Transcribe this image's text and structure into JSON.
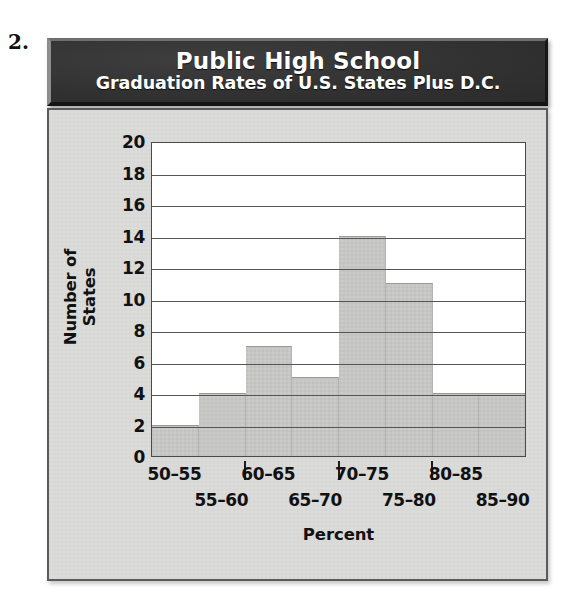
{
  "problem_number": "2.",
  "title": {
    "line1": "Public High School",
    "line2": "Graduation Rates of U.S. States Plus D.C."
  },
  "colors": {
    "banner_background": "#313131",
    "banner_text": "#ffffff",
    "panel_background": "#dcdcda",
    "plot_background": "#ffffff",
    "bar_fill": "#c9c9c7",
    "axis_line": "#4a4a4a",
    "gridline": "#555555",
    "text": "#111111"
  },
  "chart_data": {
    "type": "bar",
    "title": "Public High School Graduation Rates of U.S. States Plus D.C.",
    "xlabel": "Percent",
    "ylabel": "Number of States",
    "categories": [
      "50–55",
      "55–60",
      "60–65",
      "65–70",
      "70–75",
      "75–80",
      "80–85",
      "85–90"
    ],
    "values": [
      2,
      4,
      7,
      5,
      14,
      11,
      4,
      4
    ],
    "ylim": [
      0,
      20
    ],
    "ytick_step": 2,
    "yticks": [
      "20",
      "18",
      "16",
      "14",
      "12",
      "10",
      "8",
      "6",
      "4",
      "2",
      "0"
    ],
    "ytick_values": [
      20,
      18,
      16,
      14,
      12,
      10,
      8,
      6,
      4,
      2,
      0
    ],
    "grid": true,
    "grid_axis": "y",
    "legend": false,
    "total": 51,
    "xtick_rows": {
      "top": [
        "50–55",
        "60–65",
        "70–75",
        "80–85"
      ],
      "bottom": [
        "55–60",
        "65–70",
        "75–80",
        "85–90"
      ]
    }
  }
}
